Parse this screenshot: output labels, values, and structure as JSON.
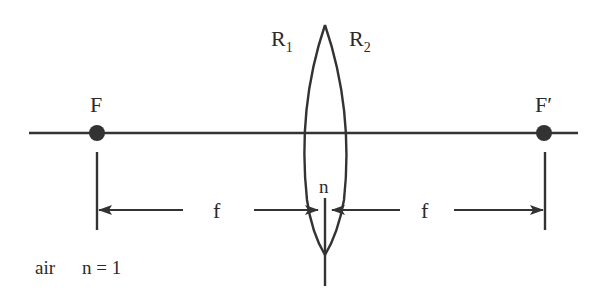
{
  "diagram": {
    "type": "thin-lens-focal-geometry",
    "colors": {
      "ink": "#333333",
      "text": "#2a2a2a",
      "background": "#ffffff"
    },
    "labels": {
      "radius_left": {
        "main": "R",
        "sub": "1"
      },
      "radius_right": {
        "main": "R",
        "sub": "2"
      },
      "focal_point_left": "F",
      "focal_point_right": "F′",
      "refractive_index": "n",
      "focal_length_left": "f",
      "focal_length_right": "f",
      "medium": "air",
      "medium_index": "n = 1"
    }
  }
}
